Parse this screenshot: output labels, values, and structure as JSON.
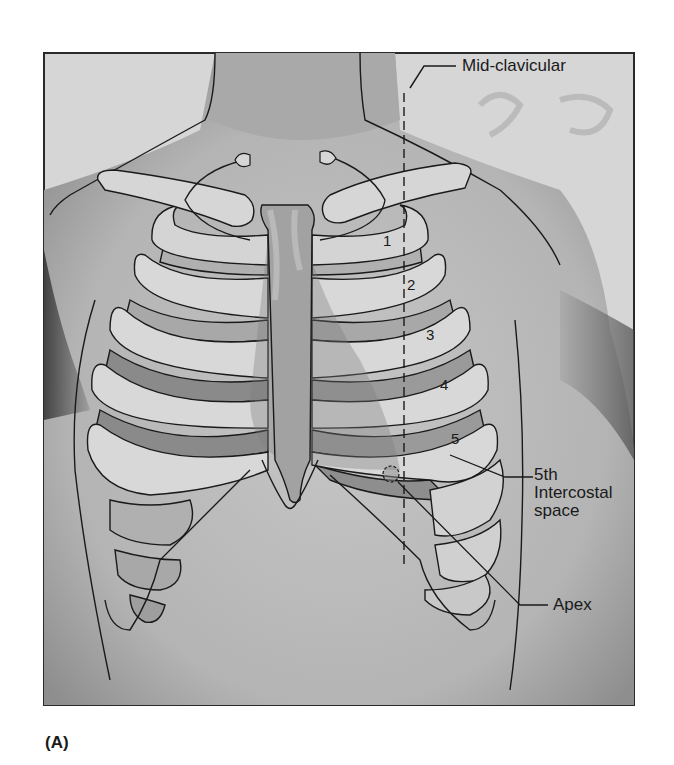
{
  "figure": {
    "caption": "(A)",
    "labels": {
      "mid_clavicular": "Mid-clavicular",
      "intercostal_line1": "5th",
      "intercostal_line2": "Intercostal",
      "intercostal_line3": "space",
      "apex": "Apex"
    },
    "rib_numbers": [
      "1",
      "2",
      "3",
      "4",
      "5"
    ],
    "colors": {
      "background": "#ffffff",
      "photo_base": "#bdbdbd",
      "rib_fill": "#d4d4d4",
      "intercostal_fill": "#a8a8a8",
      "sternum_fill": "#9e9e9e",
      "outline": "#1a1a1a"
    }
  }
}
